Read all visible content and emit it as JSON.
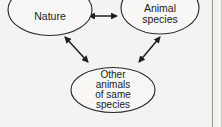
{
  "figure": {
    "background_color": "#f4f3f1",
    "stroke_color": "#2b2b2b",
    "nodes": [
      {
        "id": "nature",
        "name": "node-nature",
        "lines": [
          "Nature"
        ],
        "shape": "ellipse",
        "clipped_top": true
      },
      {
        "id": "animal-species",
        "name": "node-animal-species",
        "lines": [
          "Animal",
          "species"
        ],
        "shape": "ellipse",
        "clipped_top": true
      },
      {
        "id": "other-animals",
        "name": "node-other-animals-of-same-species",
        "lines": [
          "Other",
          "animals",
          "of same",
          "species"
        ],
        "shape": "ellipse",
        "clipped_top": false
      }
    ],
    "edges": [
      {
        "id": "nature-animal",
        "from": "nature",
        "to": "animal-species",
        "style": "double-headed-arrow",
        "orientation": "horizontal"
      },
      {
        "id": "nature-other",
        "from": "nature",
        "to": "other-animals",
        "style": "double-headed-arrow",
        "orientation": "diagonal-down-right"
      },
      {
        "id": "animal-other",
        "from": "animal-species",
        "to": "other-animals",
        "style": "double-headed-arrow",
        "orientation": "diagonal-down-left"
      }
    ],
    "page_edge": {
      "name": "page-edge-rule",
      "visible": true,
      "color": "#9a9a9a"
    }
  }
}
